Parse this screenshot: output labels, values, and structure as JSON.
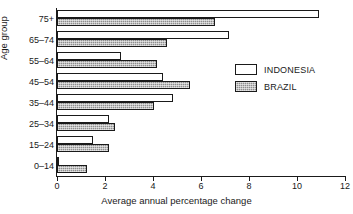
{
  "chart_data": {
    "type": "bar",
    "orientation": "horizontal",
    "title": "",
    "xlabel": "Average annual percentage change",
    "ylabel": "Age group",
    "categories": [
      "0–14",
      "15–24",
      "25–34",
      "35–44",
      "45–54",
      "55–64",
      "65–74",
      "75+"
    ],
    "xlim": [
      0,
      12
    ],
    "xticks": [
      0,
      2,
      4,
      6,
      8,
      10,
      12
    ],
    "xtick_labels": [
      "0",
      "2",
      "4",
      "6",
      "8",
      "10",
      "12"
    ],
    "grid": false,
    "legend_position": "right-center",
    "series": [
      {
        "name": "INDONESIA",
        "color": "#ffffff",
        "values": [
          0.1,
          1.5,
          2.15,
          4.85,
          4.4,
          2.65,
          7.15,
          10.9
        ]
      },
      {
        "name": "BRAZIL",
        "color": "#8e8e8e",
        "values": [
          1.25,
          2.15,
          2.4,
          4.05,
          5.55,
          4.15,
          4.6,
          6.6
        ]
      }
    ]
  },
  "legend": {
    "items": [
      {
        "label": "INDONESIA",
        "swatch": "indonesia"
      },
      {
        "label": "BRAZIL",
        "swatch": "brazil"
      }
    ]
  },
  "axes": {
    "x_title": "Average annual percentage change",
    "y_title": "Age group"
  }
}
